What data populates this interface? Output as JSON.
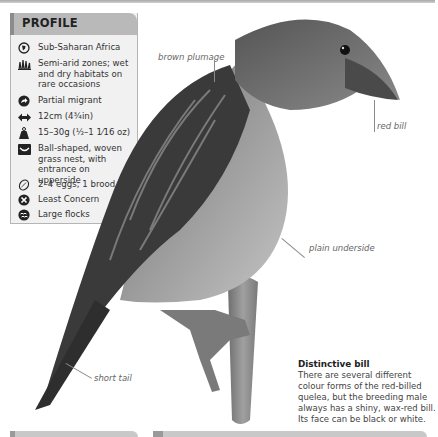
{
  "profile": {
    "title": "PROFILE",
    "items": [
      {
        "icon": "globe-icon",
        "text": "Sub-Saharan Africa"
      },
      {
        "icon": "grass-habitat-icon",
        "text": "Semi-arid zones; wet and dry habitats on rare occasions"
      },
      {
        "icon": "migration-arrow-icon",
        "text": "Partial migrant"
      },
      {
        "icon": "length-arrows-icon",
        "text": "12cm (4¾in)"
      },
      {
        "icon": "weight-icon",
        "text": "15–30g (½–1 1⁄16 oz)"
      },
      {
        "icon": "nest-icon",
        "text": "Ball-shaped, woven grass nest, with entrance on upperside"
      },
      {
        "icon": "egg-icon",
        "text": "2–4 eggs; 1 brood"
      },
      {
        "icon": "conservation-status-icon",
        "text": "Least Concern"
      },
      {
        "icon": "flock-icon",
        "text": "Large flocks"
      }
    ]
  },
  "callouts": {
    "plumage": "brown plumage",
    "bill": "red bill",
    "underside": "plain underside",
    "tail": "short tail"
  },
  "note": {
    "title": "Distinctive bill",
    "body": "There are several different colour forms of the red-billed quelea, but the breeding male always has a shiny, wax-red bill. Its face can be black or white."
  }
}
